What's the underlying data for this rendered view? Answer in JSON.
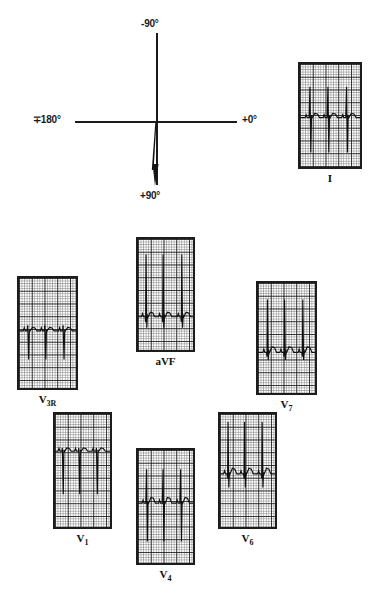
{
  "figure": {
    "type": "ecg-vector-figure",
    "background": "#ffffff",
    "ink_color": "#1a1a1a"
  },
  "vector_diagram": {
    "name": "frontal-plane-axis-diagram",
    "labels": {
      "top": "-90°",
      "left": "∓180°",
      "right": "+0°",
      "bottom": "+90°"
    },
    "axis_vector": {
      "description": "mean QRS axis arrow",
      "degrees": "+90°",
      "direction": "inferior"
    }
  },
  "strips": [
    {
      "id": "lead-I",
      "label": "I",
      "label_sub": "",
      "x": 298,
      "y": 62,
      "w": 64,
      "h": 107,
      "baseline": 0.52,
      "beats": [
        0.17,
        0.47,
        0.78
      ],
      "morphology": "rS",
      "r_amp": 0.3,
      "s_amp": 0.34,
      "q_amp": 0.0,
      "t_amp": 0.04
    },
    {
      "id": "lead-V3R",
      "label": "V",
      "label_sub": "3R",
      "x": 17,
      "y": 276,
      "w": 61,
      "h": 114,
      "baseline": 0.48,
      "beats": [
        0.16,
        0.46,
        0.78
      ],
      "morphology": "rS",
      "r_amp": 0.05,
      "s_amp": 0.26,
      "q_amp": 0.0,
      "t_amp": 0.03
    },
    {
      "id": "lead-aVF",
      "label": "aVF",
      "label_sub": "",
      "x": 136,
      "y": 237,
      "w": 59,
      "h": 115,
      "baseline": 0.7,
      "beats": [
        0.15,
        0.46,
        0.8
      ],
      "morphology": "qR",
      "r_amp": 0.56,
      "s_amp": 0.1,
      "q_amp": 0.05,
      "t_amp": 0.04
    },
    {
      "id": "lead-V7",
      "label": "V",
      "label_sub": "7",
      "x": 256,
      "y": 281,
      "w": 61,
      "h": 114,
      "baseline": 0.63,
      "beats": [
        0.17,
        0.47,
        0.79
      ],
      "morphology": "qRs",
      "r_amp": 0.48,
      "s_amp": 0.07,
      "q_amp": 0.04,
      "t_amp": 0.05
    },
    {
      "id": "lead-V1",
      "label": "V",
      "label_sub": "1",
      "x": 53,
      "y": 412,
      "w": 59,
      "h": 117,
      "baseline": 0.33,
      "beats": [
        0.14,
        0.44,
        0.76
      ],
      "morphology": "QS",
      "r_amp": 0.03,
      "s_amp": 0.38,
      "q_amp": 0.0,
      "t_amp": 0.03
    },
    {
      "id": "lead-V4",
      "label": "V",
      "label_sub": "4",
      "x": 136,
      "y": 448,
      "w": 59,
      "h": 117,
      "baseline": 0.47,
      "beats": [
        0.16,
        0.46,
        0.78
      ],
      "morphology": "RS",
      "r_amp": 0.3,
      "s_amp": 0.34,
      "q_amp": 0.0,
      "t_amp": 0.05
    },
    {
      "id": "lead-V6",
      "label": "V",
      "label_sub": "6",
      "x": 218,
      "y": 412,
      "w": 59,
      "h": 117,
      "baseline": 0.53,
      "beats": [
        0.15,
        0.45,
        0.77
      ],
      "morphology": "qRs",
      "r_amp": 0.46,
      "s_amp": 0.12,
      "q_amp": 0.04,
      "t_amp": 0.05
    }
  ]
}
